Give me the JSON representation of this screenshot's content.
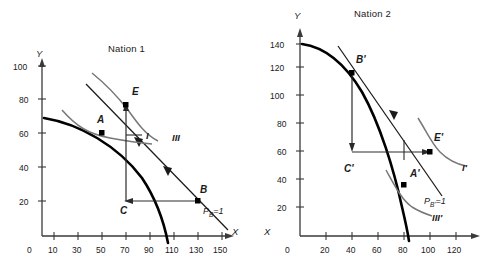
{
  "figure": {
    "kind": "economics-trade-diagram"
  },
  "panels": [
    {
      "id": "nation-1",
      "title": "Nation 1",
      "axes": {
        "x_name": "X",
        "y_name": "Y",
        "x_ticks": [
          "0",
          "10",
          "30",
          "50",
          "70",
          "90",
          "110",
          "130",
          "150"
        ],
        "x_tick_values": [
          0,
          10,
          30,
          50,
          70,
          90,
          110,
          130,
          150
        ],
        "y_ticks": [
          "20",
          "40",
          "60",
          "80",
          "100"
        ],
        "y_tick_values": [
          20,
          40,
          60,
          80,
          100
        ],
        "xlim": [
          0,
          155
        ],
        "ylim": [
          0,
          110
        ]
      },
      "points": [
        {
          "label": "A",
          "x": 50,
          "y": 60
        },
        {
          "label": "E",
          "x": 70,
          "y": 78
        },
        {
          "label": "B",
          "x": 130,
          "y": 20
        },
        {
          "label": "C",
          "x": 70,
          "y": 20
        }
      ],
      "curves": [
        {
          "label": "I",
          "type": "indifference-curve"
        },
        {
          "label": "III",
          "type": "indifference-curve"
        }
      ],
      "price_line": {
        "label": "P",
        "sub": "B",
        "equals": "=1"
      }
    },
    {
      "id": "nation-2",
      "title": "Nation 2",
      "axes": {
        "x_name": "X",
        "y_name": "Y",
        "x_ticks": [
          "0",
          "20",
          "40",
          "60",
          "80",
          "100",
          "120"
        ],
        "x_tick_values": [
          0,
          20,
          40,
          60,
          80,
          100,
          120
        ],
        "y_ticks": [
          "20",
          "40",
          "60",
          "80",
          "100",
          "120",
          "140"
        ],
        "y_tick_values": [
          20,
          40,
          60,
          80,
          100,
          120,
          140
        ],
        "xlim": [
          0,
          130
        ],
        "ylim": [
          0,
          150
        ]
      },
      "points": [
        {
          "label": "B'",
          "x": 40,
          "y": 118
        },
        {
          "label": "E'",
          "x": 100,
          "y": 60
        },
        {
          "label": "A'",
          "x": 80,
          "y": 37
        },
        {
          "label": "C'",
          "x": 40,
          "y": 60
        }
      ],
      "curves": [
        {
          "label": "I'",
          "type": "indifference-curve"
        },
        {
          "label": "III'",
          "type": "indifference-curve"
        }
      ],
      "price_line": {
        "label": "P",
        "sub": "B'",
        "equals": "=1"
      }
    }
  ],
  "colors": {
    "axis": "#3a3a3a",
    "ppf": "#000000",
    "indifference": "#666666",
    "price": "#1a1a1a",
    "trade_arrow": "#2a2a2a",
    "text": "#1a1a1a"
  }
}
